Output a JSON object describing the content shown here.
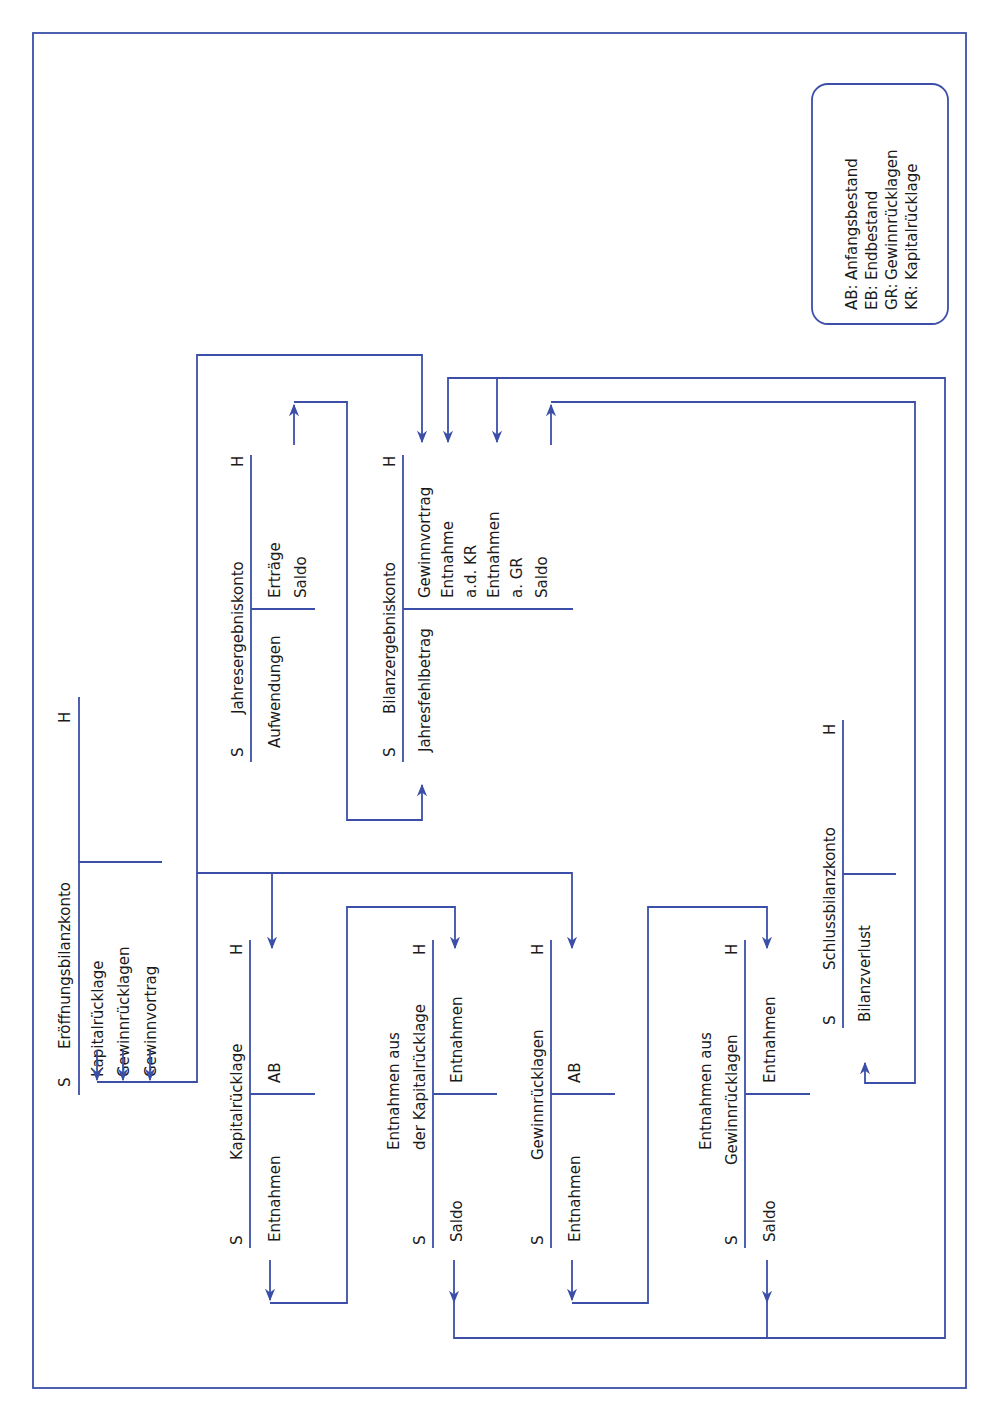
{
  "diagram": {
    "colors": {
      "line": "#3b4fa8",
      "text": "#1a1a1a",
      "background": "#ffffff"
    },
    "orientation": "rotated 90 degrees counter-clockwise",
    "legend": {
      "items": [
        {
          "abbr": "AB:",
          "text": "Anfangsbestand"
        },
        {
          "abbr": "EB:",
          "text": "Endbestand"
        },
        {
          "abbr": "GR:",
          "text": "Gewinnrücklagen"
        },
        {
          "abbr": "KR:",
          "text": "Kapitalrücklage"
        }
      ]
    },
    "side_labels": {
      "debit": "S",
      "credit": "H"
    },
    "accounts": {
      "eroeffnung": {
        "title": "Eröffnungsbilanzkonto",
        "debit": [],
        "credit": [
          "Kapitalrücklage",
          "Gewinnrücklagen",
          "Gewinnvortrag"
        ]
      },
      "jahresergebnis": {
        "title": "Jahresergebniskonto",
        "debit": [
          "Aufwendungen"
        ],
        "credit": [
          "Erträge",
          "Saldo"
        ]
      },
      "bilanzergebnis": {
        "title": "Bilanzergebniskonto",
        "debit": [
          "Jahresfehlbetrag"
        ],
        "credit": [
          "Gewinnvortrag",
          "Entnahme",
          "a.d. KR",
          "Entnahmen",
          "a. GR",
          "Saldo"
        ]
      },
      "kapitalruecklage": {
        "title": "Kapitalrücklage",
        "debit": [
          "Entnahmen"
        ],
        "credit": [
          "AB"
        ]
      },
      "entnahmen_kr": {
        "title_line1": "Entnahmen aus",
        "title_line2": "der Kapitalrücklage",
        "debit": [
          "Saldo"
        ],
        "credit": [
          "Entnahmen"
        ]
      },
      "gewinnruecklagen": {
        "title": "Gewinnrücklagen",
        "debit": [
          "Entnahmen"
        ],
        "credit": [
          "AB"
        ]
      },
      "entnahmen_gr": {
        "title_line1": "Entnahmen aus",
        "title_line2": "Gewinnrücklagen",
        "debit": [
          "Saldo"
        ],
        "credit": [
          "Entnahmen"
        ]
      },
      "schlussbilanz": {
        "title": "Schlussbilanzkonto",
        "debit": [
          "Bilanzverlust"
        ],
        "credit": []
      }
    }
  }
}
